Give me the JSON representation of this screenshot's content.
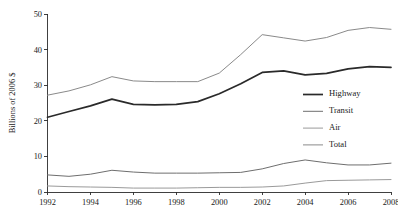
{
  "chart_data": {
    "type": "line",
    "title": "",
    "xlabel": "",
    "ylabel": "Billions of 2006 $",
    "xlim": [
      1992,
      2008
    ],
    "ylim": [
      0,
      50
    ],
    "xticks": [
      1992,
      1994,
      1996,
      1998,
      2000,
      2002,
      2004,
      2006,
      2008
    ],
    "xtick_labels": [
      "1992",
      "1994",
      "1996",
      "1998",
      "2000",
      "2002",
      "2004",
      "2006",
      "2008"
    ],
    "yticks": [
      0,
      10,
      20,
      30,
      40,
      50
    ],
    "ytick_labels": [
      "0",
      "10",
      "20",
      "30",
      "40",
      "50"
    ],
    "grid": false,
    "legend_position": "center-right",
    "x": [
      1992,
      1993,
      1994,
      1995,
      1996,
      1997,
      1998,
      1999,
      2000,
      2001,
      2002,
      2003,
      2004,
      2005,
      2006,
      2007,
      2008
    ],
    "series": [
      {
        "name": "Highway",
        "color": "#2a2a2a",
        "width": 1.7,
        "values": [
          21.0,
          22.6,
          24.2,
          26.1,
          24.6,
          24.5,
          24.6,
          25.4,
          27.6,
          30.4,
          33.6,
          34.0,
          32.9,
          33.3,
          34.6,
          35.2,
          35.0
        ]
      },
      {
        "name": "Transit",
        "color": "#6e6e6e",
        "width": 1.0,
        "values": [
          4.8,
          4.4,
          5.0,
          6.1,
          5.6,
          5.3,
          5.3,
          5.3,
          5.4,
          5.5,
          6.5,
          8.0,
          9.0,
          8.2,
          7.6,
          7.6,
          8.1
        ]
      },
      {
        "name": "Air",
        "color": "#9a9a9a",
        "width": 1.0,
        "values": [
          1.7,
          1.5,
          1.4,
          1.3,
          1.1,
          1.1,
          1.1,
          1.2,
          1.3,
          1.3,
          1.4,
          1.7,
          2.5,
          3.2,
          3.3,
          3.4,
          3.5
        ]
      },
      {
        "name": "Total",
        "color": "#8a8a8a",
        "width": 1.0,
        "values": [
          27.2,
          28.4,
          30.1,
          32.4,
          31.2,
          31.0,
          31.0,
          31.0,
          33.4,
          38.6,
          44.2,
          43.3,
          42.4,
          43.4,
          45.4,
          46.2,
          45.7
        ]
      }
    ]
  },
  "legend": {
    "entries": [
      {
        "label": "Highway"
      },
      {
        "label": "Transit"
      },
      {
        "label": "Air"
      },
      {
        "label": "Total"
      }
    ]
  }
}
